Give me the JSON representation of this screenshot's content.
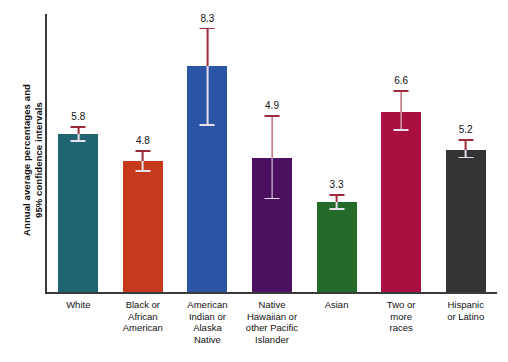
{
  "chart_data": {
    "type": "bar",
    "title": "",
    "xlabel": "",
    "ylabel": "Annual average percentages and\n95% confidence intervals",
    "ylim": [
      0,
      10.2
    ],
    "grid": false,
    "legend": "none",
    "categories": [
      "White",
      "Black or\nAfrican\nAmerican",
      "American\nIndian or\nAlaska\nNative",
      "Native\nHawaiian or\nother Pacific\nIslander",
      "Asian",
      "Two or\nmore\nraces",
      "Hispanic\nor Latino"
    ],
    "values": [
      5.8,
      4.8,
      8.3,
      4.9,
      3.3,
      6.6,
      5.2
    ],
    "value_labels": [
      "5.8",
      "4.8",
      "8.3",
      "4.9",
      "3.3",
      "6.6",
      "5.2"
    ],
    "ci_low": [
      5.5,
      4.4,
      6.1,
      3.4,
      3.0,
      5.9,
      4.9
    ],
    "ci_high": [
      6.1,
      5.2,
      9.7,
      6.5,
      3.6,
      7.4,
      5.6
    ],
    "bar_colors": [
      "#1f6470",
      "#c53a1c",
      "#2a55a5",
      "#4b1060",
      "#246b2b",
      "#a81040",
      "#343434"
    ],
    "errorbar_color_above": "#9e2b3a",
    "errorbar_color_inside": "#e8e0ec",
    "axis_color": "#3a3a3a",
    "background": "#ffffff",
    "text_color": "#111111"
  }
}
